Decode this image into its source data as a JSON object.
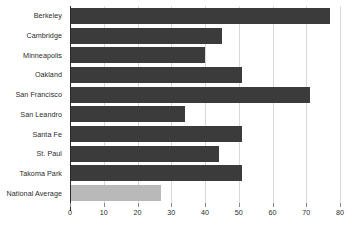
{
  "chart_data": {
    "type": "bar",
    "orientation": "horizontal",
    "title": "",
    "subtitle": "",
    "xlabel": "",
    "ylabel": "",
    "xlim": [
      0,
      80
    ],
    "xticks": [
      0,
      10,
      20,
      30,
      40,
      50,
      60,
      70,
      80
    ],
    "xtick_labels": [
      "0",
      "10",
      "20",
      "30",
      "40",
      "50",
      "60",
      "70",
      "80"
    ],
    "grid": true,
    "legend": false,
    "legend_position": "none",
    "categories": [
      "Berkeley",
      "Cambridge",
      "Minneapolis",
      "Oakland",
      "San Francisco",
      "San Leandro",
      "Santa Fe",
      "St. Paul",
      "Takoma Park",
      "National Average"
    ],
    "values": [
      77,
      45,
      40,
      51,
      71,
      34,
      51,
      44,
      51,
      27
    ],
    "bar_colors": [
      "#3b3b3b",
      "#3b3b3b",
      "#3b3b3b",
      "#3b3b3b",
      "#3b3b3b",
      "#3b3b3b",
      "#3b3b3b",
      "#3b3b3b",
      "#3b3b3b",
      "#b9b9b9"
    ],
    "series": [
      {
        "name": "value",
        "values": [
          77,
          45,
          40,
          51,
          71,
          34,
          51,
          44,
          51,
          27
        ]
      }
    ]
  },
  "colors": {
    "bar_dark": "#3b3b3b",
    "bar_light": "#b9b9b9",
    "gridline": "#d9d9d9",
    "axis": "#2b2b2b",
    "text": "#2b2b2b",
    "background": "#ffffff"
  }
}
